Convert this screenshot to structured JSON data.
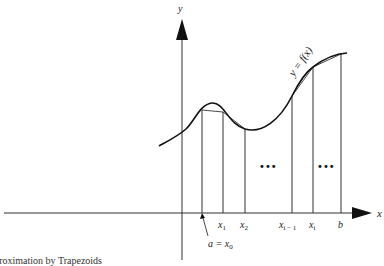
{
  "figure": {
    "axes": {
      "x_label": "x",
      "y_label": "y"
    },
    "curve_label": "y = f(x)",
    "ticks": [
      {
        "base": "x",
        "sub": "1",
        "x": 223
      },
      {
        "base": "x",
        "sub": "2",
        "x": 245
      },
      {
        "base": "x",
        "sub": "i − 1",
        "x": 292
      },
      {
        "base": "x",
        "sub": "i",
        "x": 313
      },
      {
        "base": "b",
        "sub": "",
        "x": 341
      }
    ],
    "start_label": {
      "text": "a = x",
      "sub": "0"
    },
    "ellipsis": [
      "•••",
      "•••"
    ],
    "caption": "Approximation by Trapezoids",
    "colors": {
      "ink": "#222222",
      "background": "#ffffff"
    }
  }
}
